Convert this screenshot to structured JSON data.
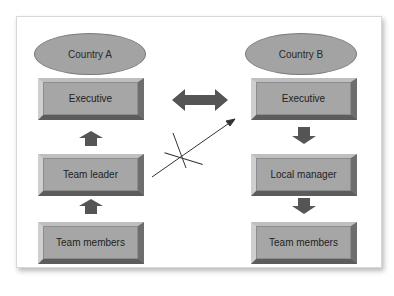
{
  "diagram": {
    "left_column": {
      "country": "Country A",
      "boxes": [
        "Executive",
        "Team leader",
        "Team members"
      ],
      "arrow_direction": "up"
    },
    "right_column": {
      "country": "Country B",
      "boxes": [
        "Executive",
        "Local manager",
        "Team members"
      ],
      "arrow_direction": "down"
    },
    "connectors": {
      "executive_link": "double-headed arrow between Executives",
      "crossed_link": "crossed-out arrow from Team leader to Country B Executive"
    },
    "colors": {
      "box_fill": "#a6a6a6",
      "ellipse_fill": "#a3a3a3",
      "arrow_fill": "#555555",
      "line": "#333333"
    }
  }
}
